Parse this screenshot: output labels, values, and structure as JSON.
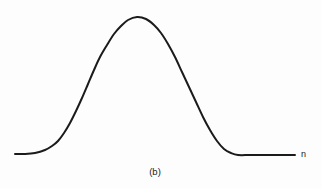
{
  "figure": {
    "caption": "(b)",
    "axis_label_x": "n",
    "background_color": "#fdfdfd",
    "curve_color": "#1b1b1b",
    "curve_width_px": 2
  },
  "chart_data": {
    "type": "line",
    "title": "",
    "subtitle": "",
    "xlabel": "n",
    "ylabel": "",
    "caption": "(b)",
    "grid": false,
    "legend": null,
    "legend_position": "none",
    "axes_visible": false,
    "tick_labels_x": [],
    "tick_labels_y": [],
    "xlim": [
      0,
      322
    ],
    "ylim": [
      0,
      189
    ],
    "annotations": [
      {
        "text": "n",
        "x": 303,
        "y": 155,
        "role": "axis-label"
      },
      {
        "text": "(b)",
        "x": 155,
        "y": 174,
        "role": "figure-caption"
      }
    ],
    "series": [
      {
        "name": "bell-curve",
        "color": "#1b1b1b",
        "points": [
          {
            "x": 15,
            "y": 154
          },
          {
            "x": 25,
            "y": 154
          },
          {
            "x": 35,
            "y": 153
          },
          {
            "x": 45,
            "y": 150
          },
          {
            "x": 52,
            "y": 146
          },
          {
            "x": 58,
            "y": 141
          },
          {
            "x": 64,
            "y": 133
          },
          {
            "x": 70,
            "y": 123
          },
          {
            "x": 76,
            "y": 111
          },
          {
            "x": 82,
            "y": 98
          },
          {
            "x": 88,
            "y": 84
          },
          {
            "x": 94,
            "y": 70
          },
          {
            "x": 100,
            "y": 57
          },
          {
            "x": 107,
            "y": 45
          },
          {
            "x": 114,
            "y": 34
          },
          {
            "x": 121,
            "y": 26
          },
          {
            "x": 128,
            "y": 20
          },
          {
            "x": 137,
            "y": 17
          },
          {
            "x": 146,
            "y": 19
          },
          {
            "x": 154,
            "y": 25
          },
          {
            "x": 161,
            "y": 33
          },
          {
            "x": 168,
            "y": 44
          },
          {
            "x": 175,
            "y": 57
          },
          {
            "x": 182,
            "y": 72
          },
          {
            "x": 189,
            "y": 87
          },
          {
            "x": 196,
            "y": 102
          },
          {
            "x": 203,
            "y": 117
          },
          {
            "x": 210,
            "y": 130
          },
          {
            "x": 217,
            "y": 141
          },
          {
            "x": 224,
            "y": 149
          },
          {
            "x": 231,
            "y": 153
          },
          {
            "x": 238,
            "y": 155
          },
          {
            "x": 250,
            "y": 155
          },
          {
            "x": 265,
            "y": 155
          },
          {
            "x": 280,
            "y": 155
          },
          {
            "x": 295,
            "y": 155
          }
        ]
      }
    ]
  }
}
